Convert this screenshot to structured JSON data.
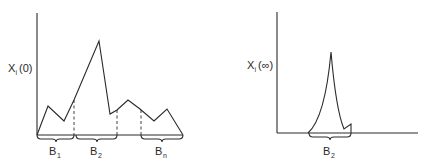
{
  "diagram": {
    "left_panel": {
      "y_label_main": "X",
      "y_label_sub": "i",
      "y_label_arg": "(0)",
      "braces": [
        {
          "label_main": "B",
          "label_sub": "1"
        },
        {
          "label_main": "B",
          "label_sub": "2"
        },
        {
          "label_main": "B",
          "label_sub": "n"
        }
      ],
      "description": "Initial distribution X_i(0) spread across multiple basins B1, B2, ..., Bn"
    },
    "right_panel": {
      "y_label_main": "X",
      "y_label_sub": "i",
      "y_label_arg": "(∞)",
      "braces": [
        {
          "label_main": "B",
          "label_sub": "2"
        }
      ],
      "description": "Asymptotic distribution X_i(∞) concentrated in basin B2"
    },
    "colors": {
      "ink": "#2a2a2a",
      "background": "#ffffff"
    }
  }
}
